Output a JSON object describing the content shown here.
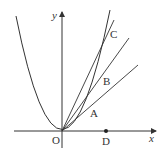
{
  "diagram": {
    "type": "coordinate-geometry",
    "colors": {
      "stroke": "#333333",
      "background": "#ffffff"
    },
    "axes": {
      "x_label": "x",
      "y_label": "y",
      "origin_label": "O"
    },
    "points": [
      {
        "id": "A",
        "label": "A",
        "on": "parabola"
      },
      {
        "id": "B",
        "label": "B",
        "on": "parabola"
      },
      {
        "id": "C",
        "label": "C",
        "on": "parabola"
      },
      {
        "id": "D",
        "label": "D",
        "on": "x-axis"
      }
    ],
    "lines": [
      {
        "from": "O",
        "through": "A"
      },
      {
        "from": "O",
        "through": "B"
      },
      {
        "from": "O",
        "through": "C"
      }
    ]
  }
}
